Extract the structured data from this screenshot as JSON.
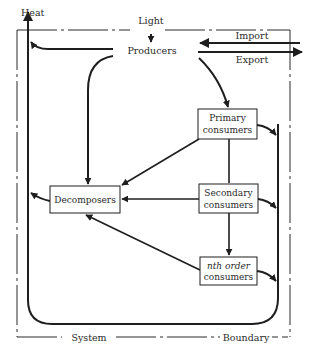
{
  "diagram": {
    "type": "ecosystem energy/matter flow diagram",
    "labels": {
      "heat": "Heat",
      "light": "Light",
      "import": "Import",
      "export": "Export",
      "system": "System",
      "boundary": "Boundary"
    },
    "nodes": {
      "producers": {
        "label": "Producers"
      },
      "primary": {
        "line1": "Primary",
        "line2": "consumers"
      },
      "secondary": {
        "line1": "Secondary",
        "line2": "consumers"
      },
      "nth": {
        "line1": "nth order",
        "line2": "consumers"
      },
      "decomposers": {
        "label": "Decomposers"
      }
    },
    "edges": [
      {
        "from": "Light",
        "to": "Producers"
      },
      {
        "from": "Import",
        "to": "Producers"
      },
      {
        "from": "Producers",
        "to": "Export"
      },
      {
        "from": "Producers",
        "to": "Heat"
      },
      {
        "from": "Producers",
        "to": "Decomposers"
      },
      {
        "from": "Producers",
        "to": "Primary consumers"
      },
      {
        "from": "Primary consumers",
        "to": "Secondary consumers"
      },
      {
        "from": "Secondary consumers",
        "to": "nth order consumers"
      },
      {
        "from": "Primary consumers",
        "to": "Decomposers"
      },
      {
        "from": "Secondary consumers",
        "to": "Decomposers"
      },
      {
        "from": "nth order consumers",
        "to": "Decomposers"
      },
      {
        "from": "Primary consumers",
        "to": "Heat"
      },
      {
        "from": "Secondary consumers",
        "to": "Heat"
      },
      {
        "from": "nth order consumers",
        "to": "Heat"
      },
      {
        "from": "Decomposers",
        "to": "Heat"
      }
    ],
    "colors": {
      "ink": "#1e1e1e",
      "background": "#ffffff"
    }
  }
}
